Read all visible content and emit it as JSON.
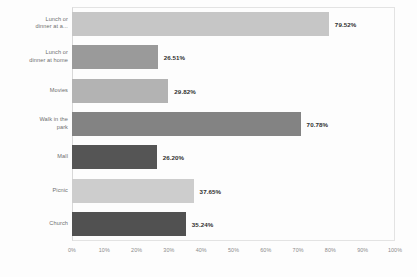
{
  "chart_data": {
    "type": "bar",
    "orientation": "horizontal",
    "title": "",
    "subtitle": "",
    "xlabel": "",
    "ylabel": "",
    "xlim": [
      0,
      100
    ],
    "grid": false,
    "legend": "none",
    "categories": [
      "Lunch or\ndinner at a...",
      "Lunch or\ndinner at home",
      "Movies",
      "Walk in the\npark",
      "Mall",
      "Picnic",
      "Church"
    ],
    "values": [
      79.52,
      26.51,
      29.82,
      70.78,
      26.2,
      37.65,
      35.24
    ],
    "value_labels": [
      "79.52%",
      "26.51%",
      "29.82%",
      "70.78%",
      "26.20%",
      "37.65%",
      "35.24%"
    ],
    "bar_colors": [
      "#c6c6c6",
      "#9a9a9a",
      "#b3b3b3",
      "#838383",
      "#555555",
      "#cdcdcd",
      "#515151"
    ],
    "xticks": [
      0,
      10,
      20,
      30,
      40,
      50,
      60,
      70,
      80,
      90,
      100
    ],
    "xtick_labels": [
      "0%",
      "10%",
      "20%",
      "30%",
      "40%",
      "50%",
      "60%",
      "70%",
      "80%",
      "90%",
      "100%"
    ]
  },
  "colors": {
    "background": "#fdfdfd",
    "axis_text": "#8b8b8b",
    "category_text": "#6d6d6d",
    "value_text": "#2f2f2f",
    "frame": "#e3e3e3"
  }
}
